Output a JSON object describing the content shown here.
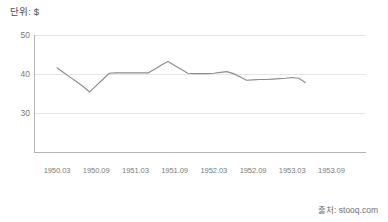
{
  "chart_data": {
    "type": "line",
    "title": "단위: $",
    "xlabel": "",
    "ylabel": "",
    "ylim": [
      20,
      50
    ],
    "yticks": [
      50,
      40,
      30
    ],
    "grid": true,
    "legend": false,
    "legend_position": "none",
    "source_note": "출처: stooq.com",
    "line_color": "#8c8c8c",
    "grid_color": "#e6e6e6",
    "axis_color": "#b3b3b3",
    "tick_label_color": "#7a7a7a",
    "xticks": [
      "1950.03",
      "1950.09",
      "1951.03",
      "1951.09",
      "1952.03",
      "1952.09",
      "1953.03",
      "1953.09"
    ],
    "x": [
      "1950.04",
      "1950.05",
      "1950.06",
      "1950.07",
      "1950.08",
      "1950.09",
      "1950.10",
      "1950.11",
      "1950.12",
      "1951.01",
      "1951.02",
      "1951.03",
      "1951.04",
      "1951.05",
      "1951.06",
      "1951.07",
      "1951.08",
      "1951.09",
      "1951.10",
      "1951.11",
      "1951.12",
      "1952.01",
      "1952.02",
      "1952.03",
      "1952.04",
      "1952.05",
      "1952.06",
      "1952.07",
      "1952.08",
      "1952.09",
      "1952.10",
      "1952.11",
      "1952.12",
      "1953.01",
      "1953.02",
      "1953.03",
      "1953.04",
      "1953.05",
      "1953.06"
    ],
    "values": [
      41.6,
      40.4,
      39.2,
      38.0,
      36.8,
      35.4,
      37.0,
      38.6,
      40.2,
      40.3,
      40.3,
      40.3,
      40.3,
      40.3,
      40.3,
      41.3,
      42.3,
      43.2,
      42.2,
      41.2,
      40.2,
      40.1,
      40.1,
      40.1,
      40.2,
      40.4,
      40.6,
      40.1,
      39.3,
      38.4,
      38.5,
      38.6,
      38.6,
      38.7,
      38.8,
      38.9,
      39.1,
      38.9,
      37.8
    ],
    "annotations": []
  },
  "canvas": {
    "width": 388,
    "height": 222,
    "background": "#ffffff"
  }
}
